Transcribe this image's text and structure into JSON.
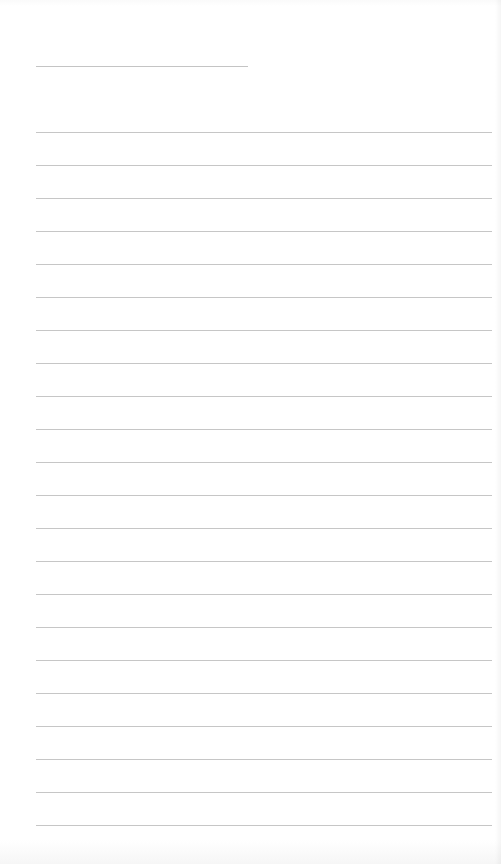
{
  "page": {
    "type": "lined-notepad",
    "background_color": "#ffffff",
    "line_color": "#c6c6c6",
    "title_line": {
      "x": 36,
      "y": 66,
      "width": 212
    },
    "rules": {
      "count": 22,
      "start_y": 132,
      "spacing": 33,
      "x": 36,
      "width": 456
    }
  }
}
